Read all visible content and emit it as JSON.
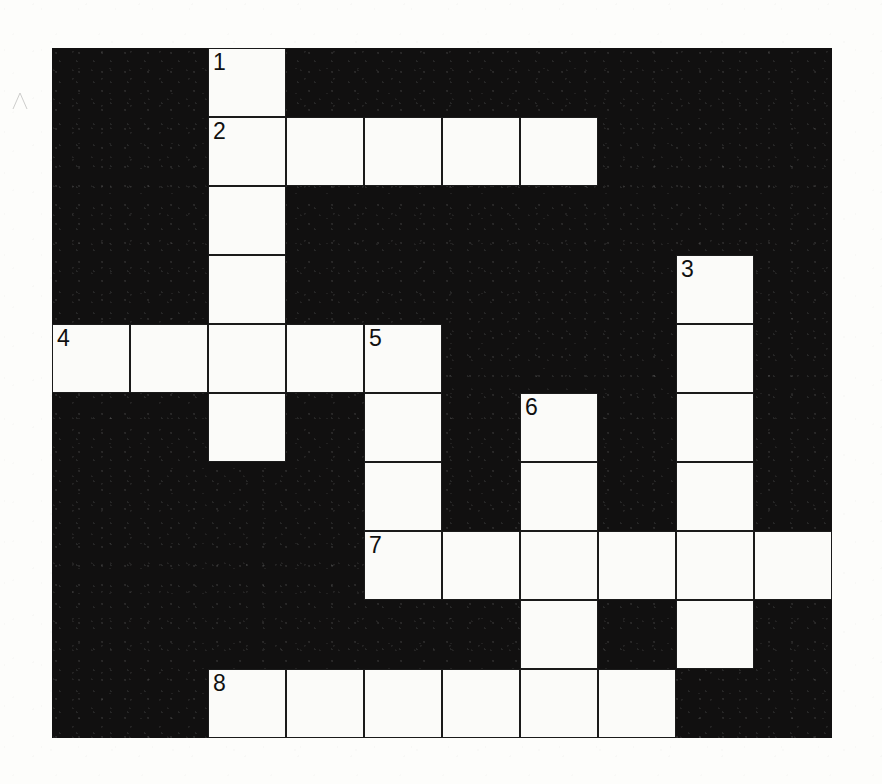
{
  "puzzle": {
    "title": "Crossword Puzzle Grid",
    "type": "crossword-grid",
    "columns": 10,
    "rows": 10,
    "cell_width": 78,
    "cell_height": 69,
    "grid_origin_x": 52,
    "grid_origin_y": 48,
    "colors": {
      "block": "#111010",
      "open_cell": "#fbfbf9",
      "cell_border": "#1a1a1a",
      "number_text": "#101010",
      "page_background": "#fdfdfb"
    },
    "numbers": [
      "1",
      "2",
      "3",
      "4",
      "5",
      "6",
      "7",
      "8"
    ],
    "clue_numbers": {
      "1": {
        "row": 0,
        "col": 2,
        "direction": "down",
        "length": 6
      },
      "2": {
        "row": 1,
        "col": 2,
        "direction": "across",
        "length": 5
      },
      "3": {
        "row": 3,
        "col": 8,
        "direction": "down",
        "length": 6
      },
      "4": {
        "row": 4,
        "col": 0,
        "direction": "across",
        "length": 5
      },
      "5": {
        "row": 4,
        "col": 4,
        "direction": "down",
        "length": 4
      },
      "6": {
        "row": 5,
        "col": 6,
        "direction": "down",
        "length": 4
      },
      "7": {
        "row": 7,
        "col": 4,
        "direction": "across",
        "length": 6
      },
      "8": {
        "row": 9,
        "col": 2,
        "direction": "across",
        "length": 6
      }
    },
    "open_cells": [
      {
        "row": 0,
        "col": 2,
        "number": "1"
      },
      {
        "row": 1,
        "col": 2,
        "number": "2"
      },
      {
        "row": 1,
        "col": 3,
        "number": ""
      },
      {
        "row": 1,
        "col": 4,
        "number": ""
      },
      {
        "row": 1,
        "col": 5,
        "number": ""
      },
      {
        "row": 1,
        "col": 6,
        "number": ""
      },
      {
        "row": 2,
        "col": 2,
        "number": ""
      },
      {
        "row": 3,
        "col": 2,
        "number": ""
      },
      {
        "row": 3,
        "col": 8,
        "number": "3"
      },
      {
        "row": 4,
        "col": 0,
        "number": "4"
      },
      {
        "row": 4,
        "col": 1,
        "number": ""
      },
      {
        "row": 4,
        "col": 2,
        "number": ""
      },
      {
        "row": 4,
        "col": 3,
        "number": ""
      },
      {
        "row": 4,
        "col": 4,
        "number": "5"
      },
      {
        "row": 4,
        "col": 8,
        "number": ""
      },
      {
        "row": 5,
        "col": 2,
        "number": ""
      },
      {
        "row": 5,
        "col": 4,
        "number": ""
      },
      {
        "row": 5,
        "col": 6,
        "number": "6"
      },
      {
        "row": 5,
        "col": 8,
        "number": ""
      },
      {
        "row": 6,
        "col": 4,
        "number": ""
      },
      {
        "row": 6,
        "col": 6,
        "number": ""
      },
      {
        "row": 6,
        "col": 8,
        "number": ""
      },
      {
        "row": 7,
        "col": 4,
        "number": "7"
      },
      {
        "row": 7,
        "col": 5,
        "number": ""
      },
      {
        "row": 7,
        "col": 6,
        "number": ""
      },
      {
        "row": 7,
        "col": 7,
        "number": ""
      },
      {
        "row": 7,
        "col": 8,
        "number": ""
      },
      {
        "row": 7,
        "col": 9,
        "number": ""
      },
      {
        "row": 8,
        "col": 6,
        "number": ""
      },
      {
        "row": 8,
        "col": 8,
        "number": ""
      },
      {
        "row": 9,
        "col": 2,
        "number": "8"
      },
      {
        "row": 9,
        "col": 3,
        "number": ""
      },
      {
        "row": 9,
        "col": 4,
        "number": ""
      },
      {
        "row": 9,
        "col": 5,
        "number": ""
      },
      {
        "row": 9,
        "col": 6,
        "number": ""
      },
      {
        "row": 9,
        "col": 7,
        "number": ""
      }
    ]
  }
}
